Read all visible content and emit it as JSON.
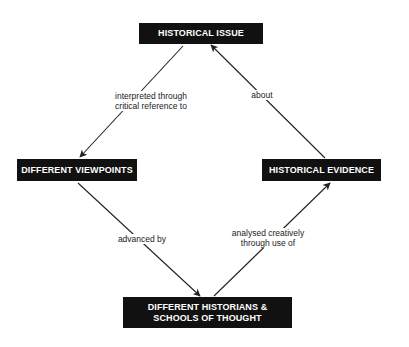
{
  "diagram": {
    "nodes": {
      "historical_issue": {
        "label": "HISTORICAL ISSUE"
      },
      "different_viewpoints": {
        "label": "DIFFERENT VIEWPOINTS"
      },
      "historical_evidence": {
        "label": "HISTORICAL EVIDENCE"
      },
      "different_historians": {
        "label_line1": "DIFFERENT HISTORIANS &",
        "label_line2": "SCHOOLS OF THOUGHT"
      }
    },
    "edges": {
      "issue_to_viewpoints": {
        "line1": "interpreted through",
        "line2": "critical reference to",
        "from": "HISTORICAL ISSUE",
        "to": "DIFFERENT VIEWPOINTS"
      },
      "evidence_to_issue": {
        "line1": "about",
        "from": "HISTORICAL EVIDENCE",
        "to": "HISTORICAL ISSUE"
      },
      "viewpoints_to_historians": {
        "line1": "advanced by",
        "from": "DIFFERENT VIEWPOINTS",
        "to": "DIFFERENT HISTORIANS & SCHOOLS OF THOUGHT"
      },
      "historians_to_evidence": {
        "line1": "analysed creatively",
        "line2": "through use of",
        "from": "DIFFERENT HISTORIANS & SCHOOLS OF THOUGHT",
        "to": "HISTORICAL EVIDENCE"
      }
    },
    "colors": {
      "node_fill": "#111111",
      "node_text": "#ffffff",
      "edge": "#222222",
      "background": "#ffffff"
    }
  }
}
